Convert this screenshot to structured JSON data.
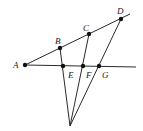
{
  "diagram": {
    "type": "geometry",
    "points": [
      {
        "id": "A",
        "label": "A",
        "x": 25,
        "y": 65,
        "lx": 13,
        "ly": 68
      },
      {
        "id": "B",
        "label": "B",
        "x": 60,
        "y": 48,
        "lx": 55,
        "ly": 44
      },
      {
        "id": "C",
        "label": "C",
        "x": 89,
        "y": 34,
        "lx": 83,
        "ly": 31
      },
      {
        "id": "D",
        "label": "D",
        "x": 121,
        "y": 19,
        "lx": 117,
        "ly": 14
      },
      {
        "id": "E",
        "label": "E",
        "x": 63,
        "y": 66,
        "lx": 68,
        "ly": 78
      },
      {
        "id": "F",
        "label": "F",
        "x": 83,
        "y": 66,
        "lx": 86,
        "ly": 78
      },
      {
        "id": "G",
        "label": "G",
        "x": 99,
        "y": 66,
        "lx": 102,
        "ly": 78
      }
    ],
    "apex": {
      "x": 70,
      "y": 126
    },
    "lines": [
      {
        "name": "ray-AD",
        "x1": 25,
        "y1": 65,
        "x2": 130,
        "y2": 14
      },
      {
        "name": "ray-AG",
        "x1": 25,
        "y1": 65,
        "x2": 136,
        "y2": 67
      },
      {
        "name": "apex-B",
        "x1": 70,
        "y1": 126,
        "x2": 60,
        "y2": 48
      },
      {
        "name": "apex-C",
        "x1": 70,
        "y1": 126,
        "x2": 89,
        "y2": 34
      },
      {
        "name": "apex-D",
        "x1": 70,
        "y1": 126,
        "x2": 121,
        "y2": 19
      }
    ]
  }
}
